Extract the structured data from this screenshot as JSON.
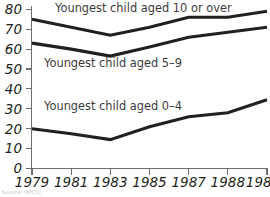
{
  "chart_data": {
    "type": "line",
    "title": "",
    "subtitle": "",
    "xlabel": "",
    "ylabel": "",
    "x": [
      "1979",
      "1981",
      "1983",
      "1985",
      "1987",
      "1988",
      "1989"
    ],
    "categories": [
      "1979",
      "1981",
      "1983",
      "1985",
      "1987",
      "1988",
      "1989"
    ],
    "xtick_labels": [
      "1979",
      "1981",
      "1983",
      "1985",
      "1987",
      "1988",
      "1989"
    ],
    "ytick_labels": [
      "0",
      "10",
      "20",
      "30",
      "40",
      "50",
      "60",
      "70",
      "80"
    ],
    "yticks": [
      0,
      10,
      20,
      30,
      40,
      50,
      60,
      70,
      80
    ],
    "ylim": [
      0,
      84
    ],
    "grid": false,
    "legend": "inline-labels",
    "legend_position": "inside-plot",
    "line_color": "#231f20",
    "axis_color": "#6d6e71",
    "series": [
      {
        "name": "Youngest child aged 10 or over",
        "label": "Youngest child aged 10 or over",
        "values": [
          75,
          71,
          67,
          71,
          76,
          76,
          79
        ]
      },
      {
        "name": "Youngest child aged 5–9",
        "label": "Youngest child aged 5–9",
        "values": [
          63,
          60,
          56.5,
          61,
          66,
          68.5,
          71
        ]
      },
      {
        "name": "Youngest child aged 0–4",
        "label": "Youngest child aged 0–4",
        "values": [
          20,
          17.5,
          14.5,
          21,
          26,
          28,
          34.5
        ]
      }
    ],
    "annotations": [
      {
        "text": "Youngest child aged 10 or over",
        "series": 0
      },
      {
        "text": "Youngest child aged 5–9",
        "series": 1
      },
      {
        "text": "Youngest child aged 0–4",
        "series": 2
      }
    ],
    "source": "Source: OPCS)"
  }
}
